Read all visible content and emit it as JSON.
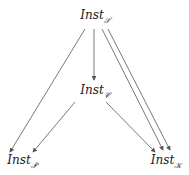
{
  "diagram": {
    "nodes": [
      {
        "id": "S",
        "base": "Inst",
        "sub": "𝒮",
        "x": 93,
        "y": 17
      },
      {
        "id": "C",
        "base": "Inst",
        "sub": "𝒞",
        "x": 93,
        "y": 92
      },
      {
        "id": "P",
        "base": "Inst",
        "sub": "𝒫",
        "x": 22,
        "y": 161
      },
      {
        "id": "K",
        "base": "Inst",
        "sub": "𝒦",
        "x": 165,
        "y": 161
      }
    ],
    "edges": [
      {
        "from": "S",
        "to": "P"
      },
      {
        "from": "S",
        "to": "C"
      },
      {
        "from": "S",
        "to": "K"
      },
      {
        "from": "S",
        "to": "K"
      },
      {
        "from": "C",
        "to": "P"
      },
      {
        "from": "C",
        "to": "K"
      }
    ],
    "line_color": "#555555"
  }
}
